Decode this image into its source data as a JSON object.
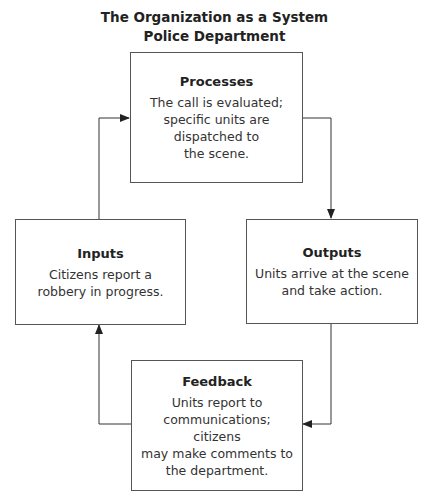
{
  "title": {
    "line1": "The Organization as a System",
    "line2": "Police Department"
  },
  "boxes": {
    "processes": {
      "title": "Processes",
      "lines": [
        "The call is evaluated;",
        "specific units are",
        "dispatched to",
        "the scene."
      ]
    },
    "inputs": {
      "title": "Inputs",
      "lines": [
        "Citizens report a",
        "robbery in progress."
      ]
    },
    "outputs": {
      "title": "Outputs",
      "lines": [
        "Units arrive at the scene",
        "and take action."
      ]
    },
    "feedback": {
      "title": "Feedback",
      "lines": [
        "Units report to",
        "communications; citizens",
        "may make comments to",
        "the department."
      ]
    }
  },
  "colors": {
    "line": "#333333",
    "border": "#555555",
    "text": "#222222"
  }
}
